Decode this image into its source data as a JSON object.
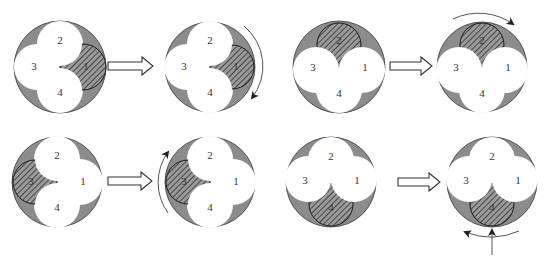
{
  "colors": {
    "background": "#ffffff",
    "casing": "#8c8c8c",
    "lobe": "#ffffff",
    "hatch_line": "#333333",
    "text": "#333333"
  },
  "panels": [
    {
      "id": "p1",
      "cx": 60,
      "cy": 67,
      "hatched": "1",
      "labels": {
        "1": "1",
        "2": "2",
        "3": "3",
        "4": "4"
      }
    },
    {
      "id": "p2",
      "cx": 210,
      "cy": 67,
      "hatched": "1",
      "labels": {
        "1": "1",
        "2": "2",
        "3": "3",
        "4": "4"
      },
      "rotation_arrow": "clockwise-right"
    },
    {
      "id": "p3",
      "cx": 339,
      "cy": 67,
      "hatched": "2",
      "labels": {
        "1": "1",
        "2": "2",
        "3": "3",
        "4": "4"
      }
    },
    {
      "id": "p4",
      "cx": 482,
      "cy": 67,
      "hatched": "2",
      "labels": {
        "1": "1",
        "2": "2",
        "3": "3",
        "4": "4"
      },
      "rotation_arrow": "clockwise-top"
    },
    {
      "id": "p5",
      "cx": 57,
      "cy": 182,
      "hatched": "3",
      "labels": {
        "1": "1",
        "2": "2",
        "3": "3",
        "4": "4"
      }
    },
    {
      "id": "p6",
      "cx": 210,
      "cy": 182,
      "hatched": "3",
      "labels": {
        "1": "1",
        "2": "2",
        "3": "3",
        "4": "4"
      },
      "rotation_arrow": "clockwise-left"
    },
    {
      "id": "p7",
      "cx": 331,
      "cy": 182,
      "hatched": "4",
      "labels": {
        "1": "1",
        "2": "2",
        "3": "3",
        "4": "4"
      }
    },
    {
      "id": "p8",
      "cx": 492,
      "cy": 182,
      "hatched": "4",
      "labels": {
        "1": "1",
        "2": "2",
        "3": "3",
        "4": "4"
      },
      "rotation_arrow": "clockwise-bottom",
      "push_arrow": "up"
    }
  ],
  "transition_arrows": [
    {
      "from": "p1",
      "to": "p2",
      "x1": 108,
      "x2": 153,
      "y": 66
    },
    {
      "from": "p3",
      "to": "p4",
      "x1": 390,
      "x2": 432,
      "y": 66
    },
    {
      "from": "p5",
      "to": "p6",
      "x1": 108,
      "x2": 152,
      "y": 181
    },
    {
      "from": "p7",
      "to": "p8",
      "x1": 398,
      "x2": 440,
      "y": 182
    }
  ]
}
